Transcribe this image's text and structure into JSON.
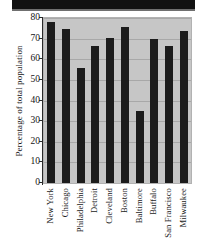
{
  "figure": {
    "header_band": "",
    "background_color": "#ffffff",
    "plot_background_color": "#c6c6c6",
    "bar_color": "#1c1c1c",
    "gridline_color": "#a8a8a8",
    "axis_color": "#2a2a2a"
  },
  "chart_data": {
    "type": "bar",
    "title": "",
    "xlabel": "",
    "ylabel": "Percentage of total population",
    "categories": [
      "New York",
      "Chicago",
      "Philadelphia",
      "Detroit",
      "Cleveland",
      "Boston",
      "Baltimore",
      "Buffalo",
      "San Francisco",
      "Milwaukee"
    ],
    "values": [
      78,
      74.5,
      56,
      66.5,
      70.5,
      75.5,
      35,
      70,
      66.5,
      73.5
    ],
    "ylim": [
      0,
      80
    ],
    "yticks": [
      0,
      10,
      20,
      30,
      40,
      50,
      60,
      70,
      80
    ],
    "ytick_labels": [
      "0",
      "10",
      "20",
      "30",
      "40",
      "50",
      "60",
      "70",
      "80"
    ],
    "grid": true,
    "legend": null,
    "legend_position": "none"
  }
}
